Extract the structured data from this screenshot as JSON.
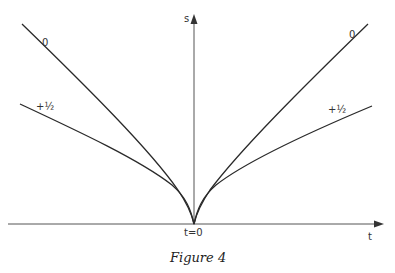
{
  "figure": {
    "caption": "Figure 4",
    "axes": {
      "x_label": "t",
      "y_label": "s",
      "origin_label": "t=0"
    },
    "curves": [
      {
        "label_left": "0",
        "label_right": "0"
      },
      {
        "label_left": "+½",
        "label_right": "+½"
      }
    ],
    "colors": {
      "line": "#2a2a2a",
      "axis": "#555555"
    }
  }
}
